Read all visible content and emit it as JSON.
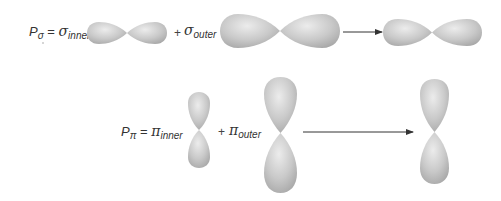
{
  "diagram": {
    "rows": [
      {
        "id": "sigma",
        "lhs": {
          "symbol": "P",
          "subscript": "σ"
        },
        "equals": "=",
        "term1": {
          "symbol": "σ",
          "subscript": "inner"
        },
        "plus": "+",
        "term2": {
          "symbol": "σ",
          "subscript": "outer"
        },
        "orientation": "horizontal"
      },
      {
        "id": "pi",
        "lhs": {
          "symbol": "P",
          "subscript": "π"
        },
        "equals": "=",
        "term1": {
          "symbol": "π",
          "subscript": "inner"
        },
        "plus": "+",
        "term2": {
          "symbol": "π",
          "subscript": "outer"
        },
        "orientation": "vertical"
      }
    ],
    "colors": {
      "lobe_light": "#e6e6e6",
      "lobe_mid": "#c4c4c4",
      "lobe_dark": "#9a9a9a",
      "arrow": "#333333",
      "text": "#333333"
    }
  }
}
